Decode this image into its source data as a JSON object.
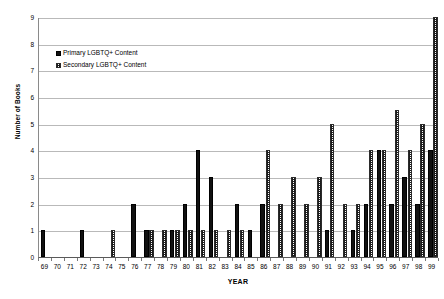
{
  "chart_data": {
    "type": "bar",
    "title": "",
    "xlabel": "YEAR",
    "ylabel": "Number of Books",
    "ylim": [
      0,
      9
    ],
    "ytick_step": 1,
    "yticks": [
      0,
      1,
      2,
      3,
      4,
      5,
      6,
      7,
      8,
      9
    ],
    "grid": true,
    "grid_axis": "y",
    "legend_position": "upper-left-inside",
    "categories": [
      "69",
      "70",
      "71",
      "72",
      "73",
      "74",
      "75",
      "76",
      "77",
      "78",
      "79",
      "80",
      "81",
      "82",
      "83",
      "84",
      "85",
      "86",
      "87",
      "88",
      "89",
      "90",
      "91",
      "92",
      "93",
      "94",
      "95",
      "96",
      "97",
      "98",
      "99"
    ],
    "series": [
      {
        "name": "Primary LGBTQ+ Content",
        "style": "solid-black",
        "color": "#111111",
        "values": [
          1,
          0,
          0,
          1,
          0,
          0,
          0,
          2,
          1,
          0,
          1,
          2,
          4,
          3,
          0,
          2,
          1,
          2,
          0,
          0,
          0,
          0,
          1,
          0,
          1,
          2,
          4,
          2,
          3,
          2,
          4
        ]
      },
      {
        "name": "Secondary LGBTQ+ Content",
        "style": "hatched",
        "color": "#1d1d1d",
        "values": [
          0,
          0,
          0,
          0,
          0,
          1,
          0,
          0,
          1,
          1,
          1,
          1,
          1,
          1,
          1,
          1,
          0,
          4,
          2,
          3,
          2,
          3,
          5,
          2,
          2,
          4,
          4,
          5.5,
          4,
          5,
          9
        ]
      }
    ]
  },
  "legend": {
    "items": [
      {
        "label": "Primary LGBTQ+ Content",
        "swatch": "solid-black-swatch"
      },
      {
        "label": "Secondary LGBTQ+ Content",
        "swatch": "hatched-swatch"
      }
    ]
  },
  "axes": {
    "y_title": "Number of Books",
    "x_title": "YEAR"
  }
}
